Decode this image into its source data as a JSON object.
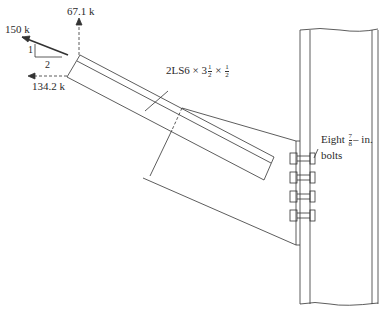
{
  "diagram": {
    "title": "",
    "type": "structural-connection-detail",
    "forces": {
      "axial": {
        "label": "150 k",
        "direction": "up-left"
      },
      "vertical_component": {
        "label": "67.1 k",
        "direction": "up"
      },
      "horizontal_component": {
        "label": "134.2 k",
        "direction": "left"
      }
    },
    "slope_triangle": {
      "rise": "1",
      "run": "2"
    },
    "member_label": {
      "prefix": "2LS6 × 3",
      "frac1_num": "1",
      "frac1_den": "2",
      "sep": " × ",
      "frac2_num": "1",
      "frac2_den": "2"
    },
    "bolt_label": {
      "prefix": "Eight",
      "frac_num": "7",
      "frac_den": "8",
      "suffix": "– in.",
      "line2": "bolts"
    },
    "bolt_count_visible_rows": 4,
    "colors": {
      "line": "#333333",
      "background": "#ffffff"
    }
  }
}
